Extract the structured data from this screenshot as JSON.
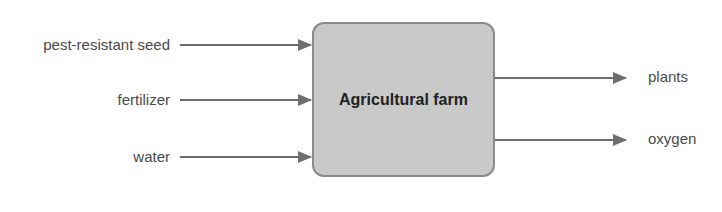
{
  "diagram": {
    "type": "process-input-output",
    "header_partial": "",
    "process": {
      "label": "Agricultural farm"
    },
    "inputs": [
      {
        "label": "pest-resistant seed"
      },
      {
        "label": "fertilizer"
      },
      {
        "label": "water"
      }
    ],
    "outputs": [
      {
        "label": "plants"
      },
      {
        "label": "oxygen"
      }
    ],
    "colors": {
      "arrow": "#6e6e6e",
      "box_fill": "#c9c9c9",
      "box_border": "#8a8a8a",
      "text": "#4a4a4a"
    }
  }
}
